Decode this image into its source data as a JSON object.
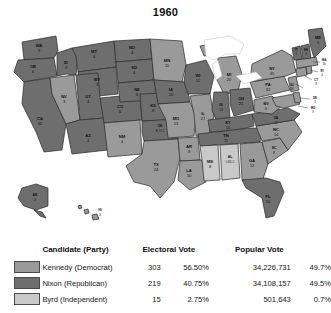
{
  "title": "1960",
  "colors": {
    "kennedy": "#9a9a9a",
    "nixon": "#6e6e6e",
    "byrd": "#c9c9c9",
    "border": "#2a2a2a",
    "background": "#ffffff"
  },
  "legend": {
    "headers": {
      "candidate": "Candidate (Party)",
      "electoral": "Electoral Vote",
      "popular": "Popular Vote"
    },
    "rows": [
      {
        "swatch": "kennedy",
        "name": "Kennedy (Democrat)",
        "electoral": "303",
        "electoral_pct": "56.50%",
        "popular": "34,226,731",
        "popular_pct": "49.7%"
      },
      {
        "swatch": "nixon",
        "name": "Nixon (Republican)",
        "electoral": "219",
        "electoral_pct": "40.75%",
        "popular": "34,108,157",
        "popular_pct": "49.5%"
      },
      {
        "swatch": "byrd",
        "name": "Byrd (Independent)",
        "electoral": "15",
        "electoral_pct": "2.75%",
        "popular": "501,643",
        "popular_pct": "0.7%"
      }
    ]
  },
  "chart_data": {
    "type": "map",
    "title": "1960",
    "subtitle": "United States presidential election results by state",
    "legend_position": "bottom",
    "categories": [
      "Kennedy (Democrat)",
      "Nixon (Republican)",
      "Byrd (Independent)"
    ],
    "series": [
      {
        "name": "Electoral Vote",
        "values": [
          303,
          219,
          15
        ]
      },
      {
        "name": "Electoral Vote %",
        "values": [
          56.5,
          40.75,
          2.75
        ]
      },
      {
        "name": "Popular Vote",
        "values": [
          34226731,
          34108157,
          501643
        ]
      },
      {
        "name": "Popular Vote %",
        "values": [
          49.7,
          49.5,
          0.7
        ]
      }
    ],
    "states": [
      {
        "code": "WA",
        "name": "Washington",
        "electoral": "9",
        "winner": "nixon"
      },
      {
        "code": "OR",
        "name": "Oregon",
        "electoral": "6",
        "winner": "nixon"
      },
      {
        "code": "CA",
        "name": "California",
        "electoral": "32",
        "winner": "nixon"
      },
      {
        "code": "NV",
        "name": "Nevada",
        "electoral": "3",
        "winner": "kennedy"
      },
      {
        "code": "ID",
        "name": "Idaho",
        "electoral": "4",
        "winner": "nixon"
      },
      {
        "code": "MT",
        "name": "Montana",
        "electoral": "4",
        "winner": "nixon"
      },
      {
        "code": "WY",
        "name": "Wyoming",
        "electoral": "3",
        "winner": "nixon"
      },
      {
        "code": "UT",
        "name": "Utah",
        "electoral": "4",
        "winner": "nixon"
      },
      {
        "code": "AZ",
        "name": "Arizona",
        "electoral": "4",
        "winner": "nixon"
      },
      {
        "code": "CO",
        "name": "Colorado",
        "electoral": "6",
        "winner": "nixon"
      },
      {
        "code": "NM",
        "name": "New Mexico",
        "electoral": "4",
        "winner": "kennedy"
      },
      {
        "code": "ND",
        "name": "North Dakota",
        "electoral": "4",
        "winner": "nixon"
      },
      {
        "code": "SD",
        "name": "South Dakota",
        "electoral": "4",
        "winner": "nixon"
      },
      {
        "code": "NE",
        "name": "Nebraska",
        "electoral": "6",
        "winner": "nixon"
      },
      {
        "code": "KS",
        "name": "Kansas",
        "electoral": "8",
        "winner": "nixon"
      },
      {
        "code": "OK",
        "name": "Oklahoma",
        "electoral": "R-7/I-1",
        "winner": "nixon"
      },
      {
        "code": "TX",
        "name": "Texas",
        "electoral": "24",
        "winner": "kennedy"
      },
      {
        "code": "MN",
        "name": "Minnesota",
        "electoral": "11",
        "winner": "kennedy"
      },
      {
        "code": "IA",
        "name": "Iowa",
        "electoral": "10",
        "winner": "nixon"
      },
      {
        "code": "MO",
        "name": "Missouri",
        "electoral": "13",
        "winner": "kennedy"
      },
      {
        "code": "AR",
        "name": "Arkansas",
        "electoral": "8",
        "winner": "kennedy"
      },
      {
        "code": "LA",
        "name": "Louisiana",
        "electoral": "10",
        "winner": "kennedy"
      },
      {
        "code": "WI",
        "name": "Wisconsin",
        "electoral": "12",
        "winner": "nixon"
      },
      {
        "code": "IL",
        "name": "Illinois",
        "electoral": "27",
        "winner": "kennedy"
      },
      {
        "code": "MI",
        "name": "Michigan",
        "electoral": "20",
        "winner": "kennedy"
      },
      {
        "code": "IN",
        "name": "Indiana",
        "electoral": "13",
        "winner": "nixon"
      },
      {
        "code": "OH",
        "name": "Ohio",
        "electoral": "25",
        "winner": "nixon"
      },
      {
        "code": "KY",
        "name": "Kentucky",
        "electoral": "10",
        "winner": "nixon"
      },
      {
        "code": "TN",
        "name": "Tennessee",
        "electoral": "11",
        "winner": "nixon"
      },
      {
        "code": "MS",
        "name": "Mississippi",
        "electoral": "8",
        "winner": "byrd"
      },
      {
        "code": "AL",
        "name": "Alabama",
        "electoral": "I-6/D-5",
        "winner": "byrd"
      },
      {
        "code": "GA",
        "name": "Georgia",
        "electoral": "12",
        "winner": "kennedy"
      },
      {
        "code": "FL",
        "name": "Florida",
        "electoral": "10",
        "winner": "nixon"
      },
      {
        "code": "SC",
        "name": "South Carolina",
        "electoral": "8",
        "winner": "kennedy"
      },
      {
        "code": "NC",
        "name": "North Carolina",
        "electoral": "14",
        "winner": "kennedy"
      },
      {
        "code": "VA",
        "name": "Virginia",
        "electoral": "12",
        "winner": "nixon"
      },
      {
        "code": "WV",
        "name": "West Virginia",
        "electoral": "8",
        "winner": "kennedy"
      },
      {
        "code": "MD",
        "name": "Maryland",
        "electoral": "9",
        "winner": "kennedy"
      },
      {
        "code": "DE",
        "name": "Delaware",
        "electoral": "3",
        "winner": "kennedy"
      },
      {
        "code": "PA",
        "name": "Pennsylvania",
        "electoral": "32",
        "winner": "kennedy"
      },
      {
        "code": "NJ",
        "name": "New Jersey",
        "electoral": "16",
        "winner": "kennedy"
      },
      {
        "code": "NY",
        "name": "New York",
        "electoral": "45",
        "winner": "kennedy"
      },
      {
        "code": "CT",
        "name": "Connecticut",
        "electoral": "8",
        "winner": "kennedy"
      },
      {
        "code": "RI",
        "name": "Rhode Island",
        "electoral": "4",
        "winner": "kennedy"
      },
      {
        "code": "MA",
        "name": "Massachusetts",
        "electoral": "16",
        "winner": "kennedy"
      },
      {
        "code": "VT",
        "name": "Vermont",
        "electoral": "3",
        "winner": "nixon"
      },
      {
        "code": "NH",
        "name": "New Hampshire",
        "electoral": "4",
        "winner": "nixon"
      },
      {
        "code": "ME",
        "name": "Maine",
        "electoral": "5",
        "winner": "nixon"
      },
      {
        "code": "AK",
        "name": "Alaska",
        "electoral": "3",
        "winner": "nixon"
      },
      {
        "code": "HI",
        "name": "Hawaii",
        "electoral": "3",
        "winner": "kennedy"
      }
    ]
  }
}
